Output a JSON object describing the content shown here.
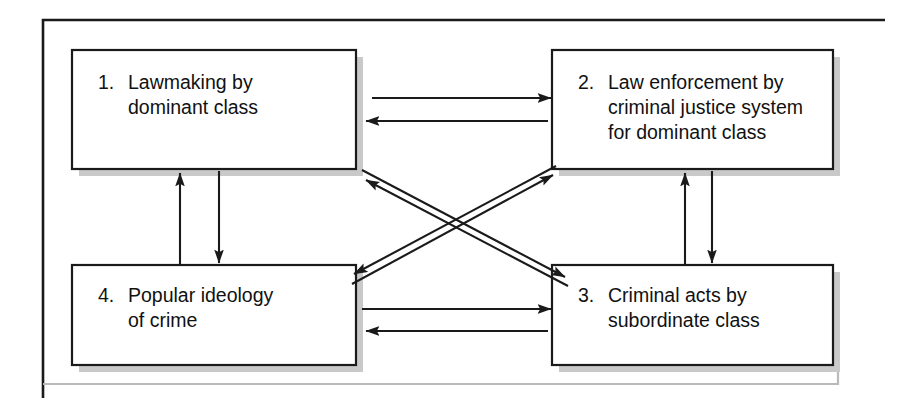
{
  "figure": {
    "type": "flow-diagram",
    "frame": {
      "style": "L-shaped rule, left and top",
      "color": "#1a1a1a"
    },
    "background_color": "#ffffff",
    "box_fill": "#ffffff",
    "box_border_color": "#1a1a1a",
    "box_shadow_color": "#c9c9c9",
    "arrow_color": "#1a1a1a"
  },
  "boxes": [
    {
      "id": "box-1",
      "number": "1.",
      "lines": [
        "Lawmaking by",
        "dominant class"
      ],
      "text": "1. Lawmaking by dominant class",
      "position": "top-left"
    },
    {
      "id": "box-2",
      "number": "2.",
      "lines": [
        "Law enforcement by",
        "criminal justice system",
        "for dominant class"
      ],
      "text": "2. Law enforcement by criminal justice system for dominant class",
      "position": "top-right"
    },
    {
      "id": "box-3",
      "number": "3.",
      "lines": [
        "Criminal acts by",
        "subordinate class"
      ],
      "text": "3. Criminal acts by subordinate class",
      "position": "bottom-right"
    },
    {
      "id": "box-4",
      "number": "4.",
      "lines": [
        "Popular ideology",
        "of crime"
      ],
      "text": "4. Popular ideology of crime",
      "position": "bottom-left"
    }
  ],
  "arrows": [
    {
      "id": "arrow-1-to-2",
      "from": "box-1",
      "to": "box-2",
      "orientation": "horizontal",
      "direction": "right"
    },
    {
      "id": "arrow-2-to-1",
      "from": "box-2",
      "to": "box-1",
      "orientation": "horizontal",
      "direction": "left"
    },
    {
      "id": "arrow-4-to-3",
      "from": "box-4",
      "to": "box-3",
      "orientation": "horizontal",
      "direction": "right"
    },
    {
      "id": "arrow-3-to-4",
      "from": "box-3",
      "to": "box-4",
      "orientation": "horizontal",
      "direction": "left"
    },
    {
      "id": "arrow-4-to-1",
      "from": "box-4",
      "to": "box-1",
      "orientation": "vertical",
      "direction": "up"
    },
    {
      "id": "arrow-1-to-4",
      "from": "box-1",
      "to": "box-4",
      "orientation": "vertical",
      "direction": "down"
    },
    {
      "id": "arrow-3-to-2",
      "from": "box-3",
      "to": "box-2",
      "orientation": "vertical",
      "direction": "up"
    },
    {
      "id": "arrow-2-to-3",
      "from": "box-2",
      "to": "box-3",
      "orientation": "vertical",
      "direction": "down"
    },
    {
      "id": "arrow-1-to-3",
      "from": "box-1",
      "to": "box-3",
      "orientation": "diagonal",
      "direction": "down-right"
    },
    {
      "id": "arrow-3-to-1",
      "from": "box-3",
      "to": "box-1",
      "orientation": "diagonal",
      "direction": "up-left"
    },
    {
      "id": "arrow-4-to-2",
      "from": "box-4",
      "to": "box-2",
      "orientation": "diagonal",
      "direction": "up-right"
    },
    {
      "id": "arrow-2-to-4",
      "from": "box-2",
      "to": "box-4",
      "orientation": "diagonal",
      "direction": "down-left"
    }
  ]
}
